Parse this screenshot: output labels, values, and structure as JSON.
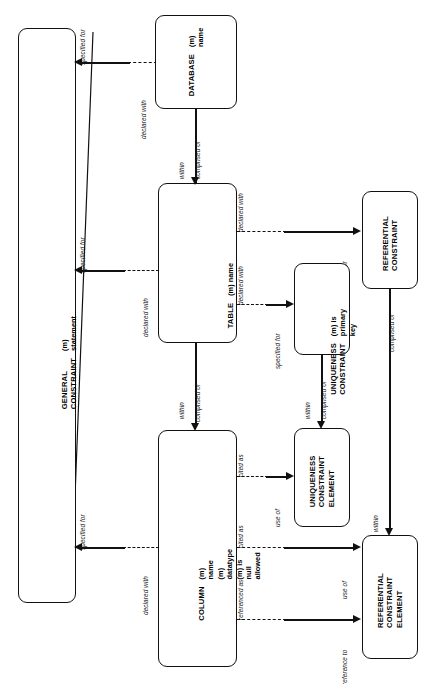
{
  "diagram": {
    "style": "IDEF1X entity-relationship diagram, rotated 90 degrees",
    "line_color": "#111111",
    "background_color": "#ffffff"
  },
  "entities": [
    {
      "id": "general-constraint",
      "name": "GENERAL\nCONSTRAINT",
      "attributes": "(m) statement"
    },
    {
      "id": "database",
      "name": "DATABASE",
      "attributes": "(m) name"
    },
    {
      "id": "table",
      "name": "TABLE",
      "attributes": "(m) name"
    },
    {
      "id": "column",
      "name": "COLUMN",
      "attributes": "(m) name\n(m) datatype\n(m) is null allowed"
    },
    {
      "id": "uniqueness-constraint",
      "name": "UNIQUENESS\nCONSTRAINT",
      "attributes": "(m) is primary key"
    },
    {
      "id": "referential-constraint",
      "name": "REFERENTIAL\nCONSTRAINT",
      "attributes": ""
    },
    {
      "id": "uniqueness-constraint-element",
      "name": "UNIQUENESS\nCONSTRAINT\nELEMENT",
      "attributes": ""
    },
    {
      "id": "referential-constraint-element",
      "name": "REFERENTIAL\nCONSTRAINT\nELEMENT",
      "attributes": ""
    }
  ],
  "relationships": [
    {
      "id": "db-gc",
      "from": "DATABASE",
      "to": "GENERAL CONSTRAINT",
      "near_label": "declared with",
      "far_label": "specified for"
    },
    {
      "id": "table-gc",
      "from": "TABLE",
      "to": "GENERAL CONSTRAINT",
      "near_label": "declared with",
      "far_label": "specified for"
    },
    {
      "id": "column-gc",
      "from": "COLUMN",
      "to": "GENERAL CONSTRAINT",
      "near_label": "declared with",
      "far_label": "specified for"
    },
    {
      "id": "db-table",
      "from": "DATABASE",
      "to": "TABLE",
      "near_label": "comprised of",
      "far_label": "within"
    },
    {
      "id": "table-column",
      "from": "TABLE",
      "to": "COLUMN",
      "near_label": "comprised of",
      "far_label": "within"
    },
    {
      "id": "table-uc",
      "from": "TABLE",
      "to": "UNIQUENESS CONSTRAINT",
      "near_label": "declared with",
      "far_label": "specified for"
    },
    {
      "id": "table-rc",
      "from": "TABLE",
      "to": "REFERENTIAL CONSTRAINT",
      "near_label": "declared with",
      "far_label": "specified for"
    },
    {
      "id": "uc-uce",
      "from": "UNIQUENESS CONSTRAINT",
      "to": "UNIQUENESS CONSTRAINT ELEMENT",
      "near_label": "comprised of",
      "far_label": "within"
    },
    {
      "id": "rc-rce",
      "from": "REFERENTIAL CONSTRAINT",
      "to": "REFERENTIAL CONSTRAINT ELEMENT",
      "near_label": "comprised of",
      "far_label": "within"
    },
    {
      "id": "column-uce",
      "from": "COLUMN",
      "to": "UNIQUENESS CONSTRAINT ELEMENT",
      "near_label": "cited as",
      "far_label": "use of"
    },
    {
      "id": "column-rce-a",
      "from": "COLUMN",
      "to": "REFERENTIAL CONSTRAINT ELEMENT",
      "near_label": "cited as",
      "far_label": "use of"
    },
    {
      "id": "column-rce-b",
      "from": "COLUMN",
      "to": "REFERENTIAL CONSTRAINT ELEMENT",
      "near_label": "referenced as",
      "far_label": "reference to"
    }
  ],
  "labels": {
    "specified_for_1": "specified for",
    "specified_for_2": "specified for",
    "specified_for_3": "specified for",
    "specified_for_uc": "specified for",
    "specified_for_rc": "specified for",
    "declared_with_db": "declared with",
    "declared_with_table": "declared with",
    "declared_with_column": "declared with",
    "declared_with_uc": "declared with",
    "declared_with_rc": "declared with",
    "comprised_of_db_table": "comprised of",
    "within_db_table": "within",
    "comprised_of_table_column": "comprised of",
    "within_table_column": "within",
    "comprised_of_uc": "comprised of",
    "within_uce": "within",
    "comprised_of_rc": "comprised of",
    "within_rce": "within",
    "cited_as_uce": "cited as",
    "use_of_uce": "use of",
    "cited_as_rce": "cited as",
    "use_of_rce": "use of",
    "referenced_as_rce": "referenced as",
    "reference_to_rce": "reference to"
  }
}
